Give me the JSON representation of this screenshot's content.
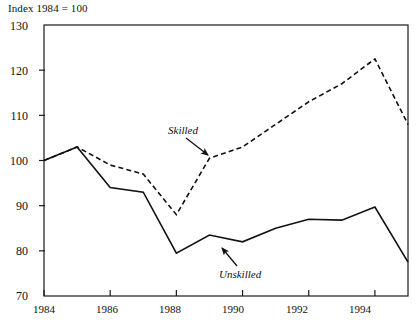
{
  "chart_data": {
    "type": "line",
    "title": "Index 1984 = 100",
    "xlabel": "",
    "ylabel": "",
    "ylim": [
      70,
      130
    ],
    "xlim": [
      1984,
      1995
    ],
    "ytick_labels": [
      "130",
      "120",
      "110",
      "100",
      "90",
      "80",
      "70"
    ],
    "yticks": [
      130,
      120,
      110,
      100,
      90,
      80,
      70
    ],
    "xtick_labels": [
      "1984",
      "1986",
      "1988",
      "1990",
      "1992",
      "1994"
    ],
    "xticks": [
      1984,
      1986,
      1988,
      1990,
      1992,
      1994
    ],
    "grid": false,
    "legend_position": "inline-annotations",
    "x": [
      1984,
      1985,
      1986,
      1987,
      1988,
      1989,
      1990,
      1991,
      1992,
      1993,
      1994,
      1995
    ],
    "series": [
      {
        "name": "Skilled",
        "style": "dashed",
        "color": "#111111",
        "values": [
          100,
          103,
          99,
          97,
          88,
          100.5,
          103,
          108,
          113,
          117,
          122.5,
          108
        ]
      },
      {
        "name": "Unskilled",
        "style": "solid",
        "color": "#111111",
        "values": [
          100,
          103,
          94,
          93,
          79.5,
          83.5,
          82,
          85,
          87,
          86.8,
          89.7,
          77.5
        ]
      }
    ],
    "annotations": [
      {
        "text": "Skilled",
        "series": "Skilled",
        "label_x": 168,
        "label_y": 124,
        "arrow_from_x": 186,
        "arrow_from_y": 138,
        "arrow_to_x": 208,
        "arrow_to_y": 155
      },
      {
        "text": "Unskilled",
        "series": "Unskilled",
        "label_x": 219,
        "label_y": 268,
        "arrow_from_x": 237,
        "arrow_from_y": 266,
        "arrow_to_x": 222,
        "arrow_to_y": 248
      }
    ]
  }
}
